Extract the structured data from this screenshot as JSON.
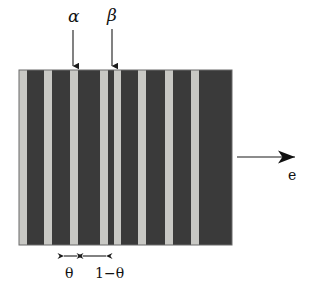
{
  "figure": {
    "background_color": "#ffffff",
    "annotations": {
      "alpha_label": "α",
      "beta_label": "β",
      "e_label": "e",
      "theta_label": "θ",
      "one_minus_theta_label": "1−θ"
    },
    "icon_names": {
      "alpha_arrow": "down-arrow-icon",
      "beta_arrow": "down-arrow-icon",
      "e_arrow": "right-arrow-icon",
      "theta_dimension": "double-headed-arrow-icon",
      "one_minus_theta_dimension": "double-headed-arrow-icon"
    }
  },
  "chart_data": {
    "type": "bar",
    "xlabel": "",
    "ylabel": "",
    "colors": {
      "alpha_phase": "#c8c8c4",
      "beta_phase": "#3a3a3a",
      "outline": "#5a5a5a",
      "arrow": "#1a1a1a",
      "background": "#ffffff"
    },
    "block": {
      "x": 19,
      "y": 70,
      "width": 213,
      "height": 175
    },
    "legend": {
      "alpha_phase": "α",
      "beta_phase": "β"
    },
    "axis_ranges": {
      "x": [
        19,
        232
      ],
      "y": [
        70,
        245
      ]
    },
    "grid": false,
    "categories": [
      "alpha-1",
      "beta-1",
      "alpha-2",
      "beta-2",
      "alpha-3",
      "beta-3",
      "alpha-4",
      "beta-4",
      "alpha-5",
      "beta-5",
      "alpha-6",
      "beta-6",
      "alpha-7",
      "beta-7",
      "alpha-8",
      "beta-8",
      "alpha-9",
      "beta-9",
      "alpha-10",
      "beta-10"
    ],
    "stripes": [
      {
        "phase": "alpha",
        "x": 19,
        "width": 8,
        "color": "#c8c8c4"
      },
      {
        "phase": "beta",
        "x": 27,
        "width": 17,
        "color": "#3a3a3a"
      },
      {
        "phase": "alpha",
        "x": 44,
        "width": 8,
        "color": "#c8c8c4"
      },
      {
        "phase": "beta",
        "x": 52,
        "width": 18,
        "color": "#3a3a3a"
      },
      {
        "phase": "alpha",
        "x": 70,
        "width": 8,
        "color": "#c8c8c4"
      },
      {
        "phase": "beta",
        "x": 78,
        "width": 22,
        "color": "#3a3a3a"
      },
      {
        "phase": "alpha",
        "x": 100,
        "width": 8,
        "color": "#c8c8c4"
      },
      {
        "phase": "beta",
        "x": 108,
        "width": 6,
        "color": "#3a3a3a"
      },
      {
        "phase": "alpha",
        "x": 114,
        "width": 7,
        "color": "#c8c8c4"
      },
      {
        "phase": "beta",
        "x": 121,
        "width": 17,
        "color": "#3a3a3a"
      },
      {
        "phase": "alpha",
        "x": 138,
        "width": 8,
        "color": "#c8c8c4"
      },
      {
        "phase": "beta",
        "x": 146,
        "width": 19,
        "color": "#3a3a3a"
      },
      {
        "phase": "alpha",
        "x": 165,
        "width": 8,
        "color": "#c8c8c4"
      },
      {
        "phase": "beta",
        "x": 173,
        "width": 18,
        "color": "#3a3a3a"
      },
      {
        "phase": "alpha",
        "x": 191,
        "width": 8,
        "color": "#c8c8c4"
      },
      {
        "phase": "beta",
        "x": 199,
        "width": 33,
        "color": "#3a3a3a"
      }
    ],
    "measurements": [
      {
        "name": "theta",
        "label": "θ",
        "x_start": 63,
        "x_end": 78,
        "y": 252
      },
      {
        "name": "one-minus-theta",
        "label": "1−θ",
        "x_start": 82,
        "x_end": 107,
        "y": 252
      }
    ],
    "pointers": [
      {
        "name": "alpha",
        "label": "α",
        "x": 73,
        "y_start": 30,
        "y_end": 68
      },
      {
        "name": "beta",
        "label": "β",
        "x": 112,
        "y_start": 30,
        "y_end": 68
      },
      {
        "name": "e",
        "label": "e",
        "x_start": 237,
        "x_end": 308,
        "y": 157
      }
    ]
  }
}
